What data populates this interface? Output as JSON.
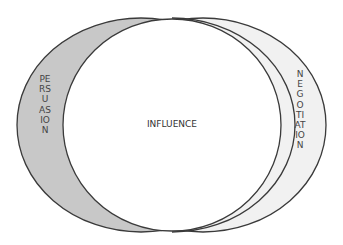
{
  "diagram": {
    "center_label": "INFLUENCE",
    "left_label": "PERSUASION",
    "right_label": "NEGOTIATION",
    "colors": {
      "left_fill": "#c8c8c8",
      "right_fill": "#f1f1f1",
      "center_fill": "#ffffff",
      "stroke": "#3a3a3a"
    }
  }
}
